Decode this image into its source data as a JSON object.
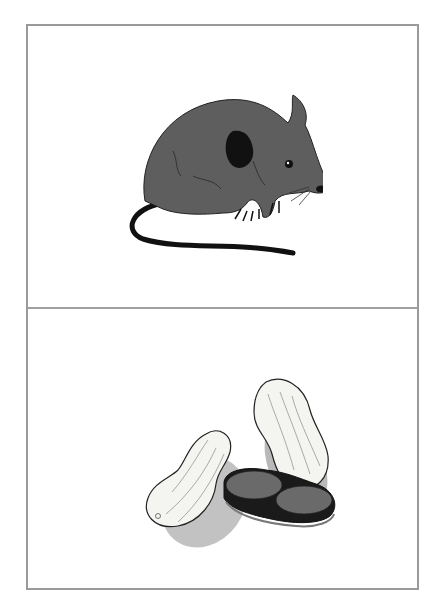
{
  "cards": [
    {
      "subject": "mouse",
      "alt": "Illustration of a gray mouse"
    },
    {
      "subject": "peanuts",
      "alt": "Illustration of peanuts in shells and shelled"
    }
  ],
  "colors": {
    "frame": "#9a9a9a",
    "mouse_body": "#5e5e5e",
    "mouse_dark": "#111111",
    "shell": "#f4f4f0",
    "nut": "#6a6a6a"
  }
}
